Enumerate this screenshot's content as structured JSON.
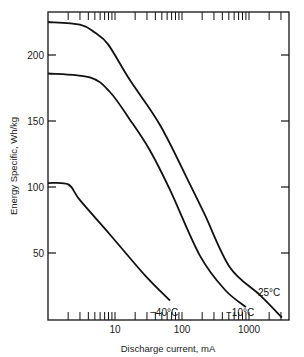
{
  "chart_data": {
    "type": "line",
    "title": "",
    "xlabel": "Discharge current, mA",
    "ylabel": "Energy Specific, Wh/kg",
    "x_scale": "log",
    "xlim": [
      1,
      4000
    ],
    "ylim": [
      0,
      233
    ],
    "grid": false,
    "legend": "inline labels near curve ends",
    "x_ticks": [
      {
        "value": 10,
        "label": "10"
      },
      {
        "value": 100,
        "label": "100"
      },
      {
        "value": 1000,
        "label": "1000"
      }
    ],
    "y_ticks": [
      {
        "value": 50,
        "label": "50"
      },
      {
        "value": 100,
        "label": "100"
      },
      {
        "value": 150,
        "label": "150"
      },
      {
        "value": 200,
        "label": "200"
      }
    ],
    "series": [
      {
        "name": "25°C",
        "label": "25°C",
        "x": [
          1,
          3,
          5,
          7.9,
          16.7,
          47,
          123,
          219,
          520,
          1460,
          3100
        ],
        "y": [
          225,
          223,
          217,
          208,
          181,
          147,
          105,
          79,
          39,
          18,
          1
        ]
      },
      {
        "name": "-10°C",
        "label": "−10°C",
        "x": [
          1,
          4.2,
          8.4,
          16.7,
          33,
          66,
          185,
          440,
          900
        ],
        "y": [
          186,
          183,
          172,
          151,
          128,
          98,
          48,
          22,
          9
        ]
      },
      {
        "name": "-40°C",
        "label": "−40°C",
        "x": [
          1,
          2,
          3,
          8.4,
          28,
          66
        ],
        "y": [
          103,
          102,
          90,
          64,
          33,
          14
        ]
      }
    ]
  }
}
